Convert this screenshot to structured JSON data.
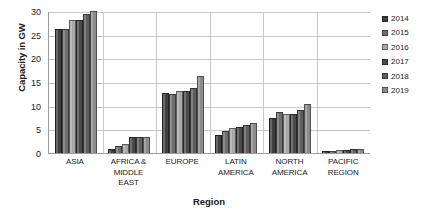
{
  "chart_data": {
    "type": "bar",
    "title": "",
    "xlabel": "Region",
    "ylabel": "Capacity in GW",
    "ylim": [
      0,
      30
    ],
    "ytick_values": [
      0,
      5,
      10,
      15,
      20,
      25,
      30
    ],
    "ytick_labels": [
      "0",
      "5",
      "10",
      "15",
      "20",
      "25",
      "30"
    ],
    "grid": true,
    "legend_position": "right",
    "categories": [
      "ASIA",
      "AFRICA & MIDDLE EAST",
      "EUROPE",
      "LATIN AMERICA",
      "NORTH AMERICA",
      "PACIFIC REGION"
    ],
    "category_label_lines": [
      [
        "ASIA"
      ],
      [
        "AFRICA &",
        "MIDDLE",
        "EAST"
      ],
      [
        "EUROPE"
      ],
      [
        "LATIN",
        "AMERICA"
      ],
      [
        "NORTH",
        "AMERICA"
      ],
      [
        "PACIFIC",
        "REGION"
      ]
    ],
    "series": [
      {
        "name": "2014",
        "color": "#3f3f3f",
        "values": [
          26.3,
          0.9,
          12.7,
          3.8,
          7.5,
          0.4
        ]
      },
      {
        "name": "2015",
        "color": "#6e6e6e",
        "values": [
          26.3,
          1.4,
          12.4,
          4.6,
          8.6,
          0.5
        ]
      },
      {
        "name": "2016",
        "color": "#a8a8a8",
        "values": [
          28.0,
          1.9,
          13.0,
          5.2,
          8.3,
          0.6
        ]
      },
      {
        "name": "2017",
        "color": "#4a4a4a",
        "values": [
          28.0,
          3.3,
          13.0,
          5.4,
          8.3,
          0.7
        ]
      },
      {
        "name": "2018",
        "color": "#5f5f5f",
        "values": [
          29.3,
          3.3,
          13.8,
          6.0,
          9.0,
          0.8
        ]
      },
      {
        "name": "2019",
        "color": "#8c8c8c",
        "values": [
          30.0,
          3.3,
          16.2,
          6.3,
          10.3,
          0.9
        ]
      }
    ]
  }
}
